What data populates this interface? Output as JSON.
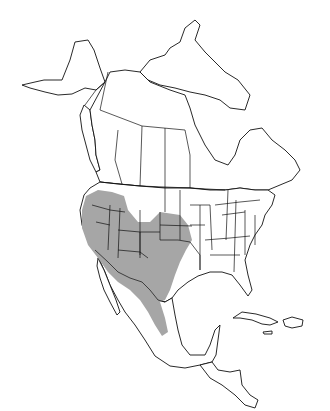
{
  "map": {
    "region": "North America",
    "type": "species range map",
    "colors": {
      "background": "#ffffff",
      "outline": "#111111",
      "range_fill": "#a6a6a6"
    },
    "legend": null,
    "range_description": "Western and south-central United States (California, Nevada, Oregon, Idaho, Utah, Arizona, Colorado, New Mexico, Nebraska, Kansas, Oklahoma, Texas) into northern and central Mexico"
  }
}
